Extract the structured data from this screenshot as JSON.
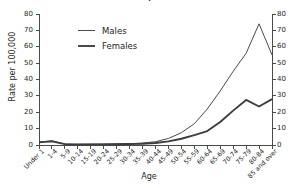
{
  "title": "Wales, 1991",
  "legend": {
    "position": "inside-top-left",
    "entries": [
      {
        "label": "Males",
        "swatch": "thin-line-swatch"
      },
      {
        "label": "Females",
        "swatch": "thick-line-swatch"
      }
    ]
  },
  "axes": {
    "y_left_title": "Rate per 100,000",
    "x_title": "Age",
    "y_ticks": [
      0,
      10,
      20,
      30,
      40,
      50,
      60,
      70,
      80
    ]
  },
  "chart_data": {
    "type": "line",
    "title": "Wales, 1991",
    "xlabel": "Age",
    "ylabel": "Rate per 100,000",
    "ylim": [
      0,
      80
    ],
    "y_ticks": [
      0,
      10,
      20,
      30,
      40,
      50,
      60,
      70,
      80
    ],
    "grid": false,
    "legend": "inside-top-left",
    "dual_y_axis": true,
    "categories": [
      "Under 1",
      "1-4",
      "5-9",
      "10-14",
      "15-19",
      "20-24",
      "25-29",
      "30-34",
      "35-39",
      "40-44",
      "45-49",
      "50-54",
      "55-59",
      "60-64",
      "65-69",
      "70-74",
      "75-79",
      "80-84",
      "85 and over"
    ],
    "series": [
      {
        "name": "Males",
        "values": [
          1.8,
          2.6,
          0.6,
          0.4,
          0.5,
          0.6,
          0.7,
          0.8,
          1.2,
          2.0,
          4.0,
          7.5,
          13.0,
          22.0,
          33.0,
          45.0,
          56.0,
          74.0,
          55.0
        ]
      },
      {
        "name": "Females",
        "values": [
          1.6,
          2.2,
          0.5,
          0.3,
          0.4,
          0.4,
          0.5,
          0.6,
          0.8,
          1.2,
          2.2,
          3.8,
          6.0,
          8.5,
          14.0,
          21.0,
          27.5,
          23.5,
          28.0
        ]
      }
    ]
  }
}
